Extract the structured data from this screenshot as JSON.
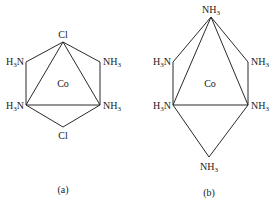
{
  "diagrams": [
    {
      "id": "a",
      "caption": "(a)",
      "center_label": "Co",
      "ligands": {
        "top": "Cl",
        "upper_left": {
          "main": "H",
          "sub": "3",
          "tail": "N"
        },
        "upper_right": {
          "main": "NH",
          "sub": "3"
        },
        "lower_left": {
          "main": "H",
          "sub": "3",
          "tail": "N"
        },
        "lower_right": {
          "main": "NH",
          "sub": "3"
        },
        "bottom": "Cl"
      }
    },
    {
      "id": "b",
      "caption": "(b)",
      "center_label": "Co",
      "ligands": {
        "top": {
          "main": "NH",
          "sub": "3"
        },
        "upper_left": {
          "main": "H",
          "sub": "3",
          "tail": "N"
        },
        "upper_right": {
          "main": "NH",
          "sub": "3"
        },
        "lower_left": {
          "main": "H",
          "sub": "3",
          "tail": "N"
        },
        "lower_right": {
          "main": "NH",
          "sub": "3"
        },
        "bottom": {
          "main": "NH",
          "sub": "3"
        }
      }
    }
  ]
}
